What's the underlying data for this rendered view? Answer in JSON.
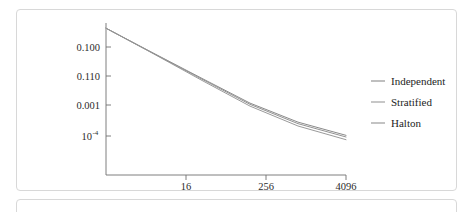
{
  "figure": {
    "background_color": "#ffffff",
    "frame_color": "#d8d8d8"
  },
  "chart_data": {
    "type": "line",
    "title": "",
    "subtitle": "",
    "xlabel": "",
    "ylabel": "",
    "xscale": "log",
    "yscale": "log",
    "grid": false,
    "legend_position": "right",
    "x": [
      4,
      16,
      64,
      256,
      1024,
      4096
    ],
    "xticks": [
      16,
      256,
      4096
    ],
    "xtick_labels": [
      "16",
      "256",
      "4096"
    ],
    "ytick_labels": [
      "0.100",
      "0.110",
      "0.001",
      "10",
      "-4"
    ],
    "ytick_label_0": "0.100",
    "ytick_label_1": "0.110",
    "ytick_label_2": "0.001",
    "ytick_label_3_base": "10",
    "ytick_label_3_exp": "-4",
    "series": [
      {
        "name": "Independent",
        "color": "#8a8a8a",
        "values": [
          0.3,
          0.046,
          0.0072,
          0.00115,
          0.00028,
          0.000105
        ]
      },
      {
        "name": "Stratified",
        "color": "#9a9a9a",
        "values": [
          0.3,
          0.044,
          0.0062,
          0.00092,
          0.00021,
          7.6e-05
        ]
      },
      {
        "name": "Halton",
        "color": "#939393",
        "values": [
          0.3,
          0.045,
          0.0068,
          0.00105,
          0.00025,
          9.3e-05
        ]
      }
    ]
  },
  "legend": {
    "entries": [
      {
        "label": "Independent",
        "color": "#8a8a8a"
      },
      {
        "label": "Stratified",
        "color": "#9a9a9a"
      },
      {
        "label": "Halton",
        "color": "#939393"
      }
    ]
  }
}
